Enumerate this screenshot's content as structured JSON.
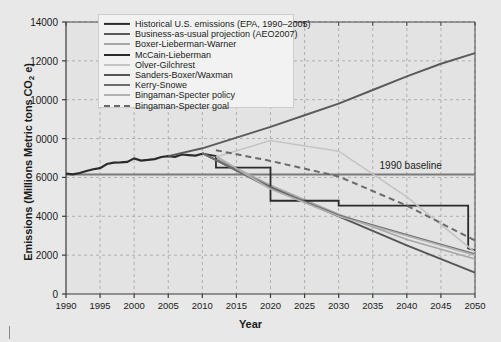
{
  "chart_data": {
    "type": "line",
    "title": "",
    "xlabel": "Year",
    "ylabel": "Emissions (Millions Metric tons CO2 e)",
    "ylabel_prefix": "Emissions (Millions Metric tons CO",
    "ylabel_sub": "2",
    "ylabel_suffix": " e)",
    "xlim": [
      1990,
      2050
    ],
    "ylim": [
      0,
      14000
    ],
    "xticks": [
      1990,
      1995,
      2000,
      2005,
      2010,
      2015,
      2020,
      2025,
      2030,
      2035,
      2040,
      2045,
      2050
    ],
    "yticks": [
      0,
      2000,
      4000,
      6000,
      "0000",
      10000,
      12000,
      14000
    ],
    "ytick_values": [
      0,
      2000,
      4000,
      6000,
      8000,
      10000,
      12000,
      14000
    ],
    "grid": true,
    "grid_style": "dashed",
    "grid_color": "#9a9a9a",
    "background": "#e8e8e8",
    "legend_position": "top-center",
    "annotations": [
      {
        "text": "1990 baseline",
        "x": 2036,
        "y": 6550,
        "line_y": 6150,
        "line_from": 1990,
        "line_to": 2050,
        "color": "#7a7a7a"
      }
    ],
    "series": [
      {
        "name": "Historical U.S. emissions (EPA, 1990–2005)",
        "color": "#2b2b2b",
        "width": 2.2,
        "dash": "solid",
        "x": [
          1990,
          1991,
          1992,
          1993,
          1994,
          1995,
          1996,
          1997,
          1998,
          1999,
          2000,
          2001,
          2002,
          2003,
          2004,
          2005,
          2006,
          2007,
          2008,
          2009,
          2010
        ],
        "y": [
          6200,
          6160,
          6230,
          6330,
          6420,
          6480,
          6690,
          6760,
          6770,
          6800,
          6980,
          6870,
          6900,
          6940,
          7050,
          7100,
          7060,
          7180,
          7150,
          7120,
          7220
        ]
      },
      {
        "name": "Business-as-usual projection (AEO2007)",
        "color": "#5a5a5a",
        "width": 1.9,
        "dash": "solid",
        "x": [
          2005,
          2010,
          2015,
          2020,
          2025,
          2030,
          2035,
          2040,
          2045,
          2050
        ],
        "y": [
          7100,
          7500,
          8050,
          8600,
          9200,
          9800,
          10500,
          11200,
          11850,
          12400
        ]
      },
      {
        "name": "Boxer-Lieberman-Warner",
        "color": "#a6a6a6",
        "width": 1.6,
        "dash": "solid",
        "x": [
          2012,
          2020,
          2030,
          2040,
          2050
        ],
        "y": [
          7000,
          5600,
          4100,
          2800,
          1800
        ]
      },
      {
        "name": "McCain-Lieberman",
        "color": "#2b2b2b",
        "width": 1.8,
        "dash": "solid",
        "x": [
          2010,
          2012,
          2012,
          2020,
          2020,
          2030,
          2030,
          2049,
          2049,
          2050
        ],
        "y": [
          7220,
          7100,
          6500,
          6500,
          4800,
          4800,
          4550,
          4550,
          2350,
          2250
        ]
      },
      {
        "name": "Olver-Gilchrest",
        "color": "#c4c4c4",
        "width": 1.6,
        "dash": "solid",
        "x": [
          2012,
          2020,
          2030,
          2040,
          2050
        ],
        "y": [
          7050,
          7900,
          7350,
          5000,
          2150
        ]
      },
      {
        "name": "Sanders-Boxer/Waxman",
        "color": "#555555",
        "width": 1.9,
        "dash": "solid",
        "x": [
          2010,
          2020,
          2030,
          2040,
          2050
        ],
        "y": [
          7250,
          5500,
          4000,
          2500,
          1100
        ]
      },
      {
        "name": "Kerry-Snowe",
        "color": "#6e6e6e",
        "width": 1.8,
        "dash": "solid",
        "x": [
          2010,
          2020,
          2030,
          2040,
          2050
        ],
        "y": [
          7250,
          5450,
          4050,
          3050,
          2050
        ]
      },
      {
        "name": "Bingaman-Specter policy",
        "color": "#b0b0b0",
        "width": 1.7,
        "dash": "solid",
        "x": [
          2012,
          2020,
          2030,
          2040,
          2050
        ],
        "y": [
          7100,
          5400,
          4000,
          3000,
          2000
        ]
      },
      {
        "name": "Bingaman-Specter goal",
        "color": "#6a6a6a",
        "width": 2.0,
        "dash": "dashed",
        "x": [
          2012,
          2020,
          2030,
          2040,
          2050
        ],
        "y": [
          7400,
          6850,
          6050,
          4550,
          2750
        ]
      }
    ]
  }
}
